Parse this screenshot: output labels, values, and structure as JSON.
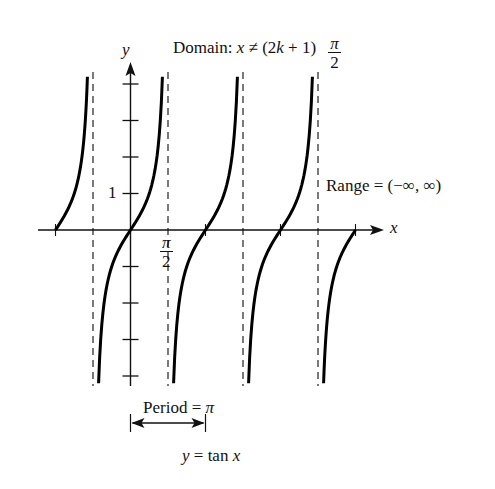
{
  "chart_data": {
    "type": "line",
    "title": "y = tan x",
    "function": "tan",
    "xlabel": "x",
    "ylabel": "y",
    "annotations": {
      "domain": "Domain: x ≠ (2k + 1) π/2",
      "range": "Range = (−∞, ∞)",
      "period": "Period = π"
    },
    "x_tick_labels": [
      {
        "value": "π/2",
        "x_radians": 1.5708
      }
    ],
    "y_tick_labels": [
      {
        "value": "1",
        "y": 1
      }
    ],
    "y_ticks": [
      -4,
      -3,
      -2,
      -1,
      1,
      2,
      3,
      4
    ],
    "zeros_radians": [
      -3.1416,
      0,
      3.1416,
      6.2832,
      9.4248
    ],
    "asymptotes_radians": [
      -1.5708,
      1.5708,
      4.7124,
      7.854
    ],
    "xlim_radians": [
      -3.9,
      10.0
    ],
    "ylim": [
      -4.2,
      4.2
    ],
    "grid": false,
    "series": [
      {
        "name": "tan x",
        "branch_centers_radians": [
          -3.1416,
          0,
          3.1416,
          6.2832,
          9.4248
        ],
        "sample_points": [
          [
            0,
            0
          ],
          [
            0.785,
            1
          ],
          [
            1.107,
            2
          ],
          [
            1.249,
            3
          ],
          [
            1.326,
            4
          ],
          [
            -0.785,
            -1
          ],
          [
            -1.107,
            -2
          ],
          [
            -1.249,
            -3
          ],
          [
            -1.326,
            -4
          ]
        ]
      }
    ]
  },
  "labels": {
    "domain_prefix": "Domain: ",
    "domain_var": "x",
    "domain_mid": " ≠ (2",
    "domain_k": "k",
    "domain_suffix": " + 1)",
    "frac_num": "π",
    "frac_den": "2",
    "y_axis": "y",
    "x_axis": "x",
    "y_tick_one": "1",
    "range": "Range = (−∞, ∞)",
    "period_text": "Period = ",
    "period_pi": "π",
    "equation_y": "y",
    "equation_mid": " = tan ",
    "equation_x": "x"
  }
}
